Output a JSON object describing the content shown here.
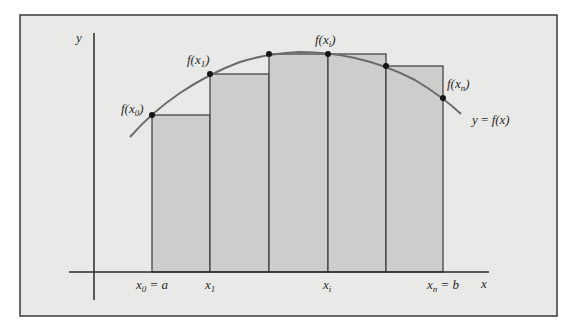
{
  "diagram": {
    "title": "",
    "colors": {
      "page_background": "#ffffff",
      "panel_background": "#e9e9e7",
      "frame": "#3a3a3a",
      "rect_fill": "#cdcdcb",
      "rect_stroke": "#3a3a3a",
      "curve": "#6a6a6a",
      "point": "#151515",
      "axis": "#2a2a2a"
    },
    "axes": {
      "x_label": "x",
      "y_label": "y"
    },
    "curve_label": {
      "lhs": "y",
      "eq": " = ",
      "rhs": "f(x)"
    },
    "point_labels": [
      {
        "f": "f(x",
        "sub": "0",
        "close": ")"
      },
      {
        "f": "f(x",
        "sub": "1",
        "close": ")"
      },
      {
        "f": "f(x",
        "sub": "i",
        "close": ")"
      },
      {
        "f": "f(x",
        "sub": "n",
        "close": ")"
      }
    ],
    "x_ticks": [
      {
        "var": "x",
        "sub": "0",
        "rest": " = a"
      },
      {
        "var": "x",
        "sub": "1",
        "rest": ""
      },
      {
        "var": "x",
        "sub": "i",
        "rest": ""
      },
      {
        "var": "x",
        "sub": "n",
        "rest": " = b"
      }
    ],
    "rectangles": [
      {
        "left": 152,
        "right": 210,
        "top": 115
      },
      {
        "left": 210,
        "right": 269,
        "top": 74
      },
      {
        "left": 269,
        "right": 328,
        "top": 54
      },
      {
        "left": 328,
        "right": 386,
        "top": 54
      },
      {
        "left": 386,
        "right": 443,
        "top": 66
      }
    ],
    "points": [
      {
        "x": 152,
        "y": 115
      },
      {
        "x": 210,
        "y": 74
      },
      {
        "x": 269,
        "y": 54
      },
      {
        "x": 328,
        "y": 54
      },
      {
        "x": 386,
        "y": 66
      },
      {
        "x": 443,
        "y": 98
      }
    ]
  }
}
